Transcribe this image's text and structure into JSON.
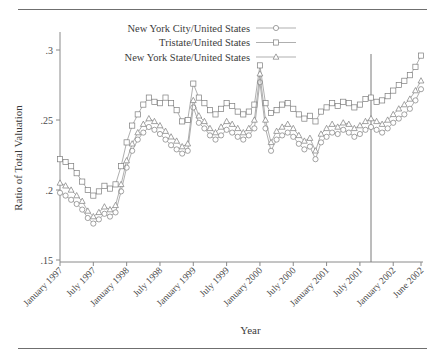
{
  "figure": {
    "ylabel": "Ratio of Total Valuation",
    "xlabel": "Year",
    "y_ticks": [
      ".3",
      ".25",
      ".2",
      ".15"
    ],
    "x_ticks": [
      "January 1997",
      "July 1997",
      "January 1998",
      "July 1998",
      "January 1999",
      "July 1999",
      "January 2000",
      "July 2000",
      "January 2001",
      "July 2001",
      "January 2002",
      "June 2002"
    ],
    "legend": [
      {
        "label": "New York City/United States",
        "marker": "circle"
      },
      {
        "label": "Tristate/United States",
        "marker": "square"
      },
      {
        "label": "New York State/United States",
        "marker": "triangle"
      }
    ],
    "colors": {
      "line": "#8c8c8c",
      "marker_fill": "#ffffff",
      "marker_stroke": "#7d7d7d",
      "vline": "#7a7a7a",
      "axis": "#8a8a8a"
    }
  },
  "chart_data": {
    "type": "line",
    "title": "",
    "xlabel": "Year",
    "ylabel": "Ratio of Total Valuation",
    "ylim": [
      0.15,
      0.305
    ],
    "grid": false,
    "legend_position": "top-center",
    "annotations": [
      {
        "type": "vertical-line",
        "x": "September 2001",
        "label": ""
      }
    ],
    "x_tick_labels": [
      "January 1997",
      "July 1997",
      "January 1998",
      "July 1998",
      "January 1999",
      "July 1999",
      "January 2000",
      "July 2000",
      "January 2001",
      "July 2001",
      "January 2002",
      "June 2002"
    ],
    "y_tick_values": [
      0.3,
      0.25,
      0.2,
      0.15
    ],
    "x": [
      "1997-01",
      "1997-02",
      "1997-03",
      "1997-04",
      "1997-05",
      "1997-06",
      "1997-07",
      "1997-08",
      "1997-09",
      "1997-10",
      "1997-11",
      "1997-12",
      "1998-01",
      "1998-02",
      "1998-03",
      "1998-04",
      "1998-05",
      "1998-06",
      "1998-07",
      "1998-08",
      "1998-09",
      "1998-10",
      "1998-11",
      "1998-12",
      "1999-01",
      "1999-02",
      "1999-03",
      "1999-04",
      "1999-05",
      "1999-06",
      "1999-07",
      "1999-08",
      "1999-09",
      "1999-10",
      "1999-11",
      "1999-12",
      "2000-01",
      "2000-02",
      "2000-03",
      "2000-04",
      "2000-05",
      "2000-06",
      "2000-07",
      "2000-08",
      "2000-09",
      "2000-10",
      "2000-11",
      "2000-12",
      "2001-01",
      "2001-02",
      "2001-03",
      "2001-04",
      "2001-05",
      "2001-06",
      "2001-07",
      "2001-08",
      "2001-09",
      "2001-10",
      "2001-11",
      "2001-12",
      "2002-01",
      "2002-02",
      "2002-03",
      "2002-04",
      "2002-05",
      "2002-06"
    ],
    "series": [
      {
        "name": "New York City/United States",
        "marker": "circle",
        "values": [
          0.198,
          0.196,
          0.193,
          0.19,
          0.186,
          0.18,
          0.176,
          0.179,
          0.183,
          0.181,
          0.184,
          0.199,
          0.216,
          0.228,
          0.236,
          0.241,
          0.245,
          0.243,
          0.24,
          0.236,
          0.232,
          0.229,
          0.226,
          0.228,
          0.259,
          0.248,
          0.244,
          0.239,
          0.236,
          0.239,
          0.243,
          0.241,
          0.238,
          0.236,
          0.239,
          0.244,
          0.277,
          0.244,
          0.228,
          0.236,
          0.239,
          0.241,
          0.238,
          0.233,
          0.229,
          0.231,
          0.222,
          0.234,
          0.238,
          0.241,
          0.24,
          0.243,
          0.241,
          0.238,
          0.24,
          0.243,
          0.245,
          0.243,
          0.241,
          0.244,
          0.248,
          0.251,
          0.254,
          0.258,
          0.264,
          0.272
        ]
      },
      {
        "name": "Tristate/United States",
        "marker": "square",
        "values": [
          0.222,
          0.22,
          0.217,
          0.212,
          0.206,
          0.2,
          0.196,
          0.199,
          0.203,
          0.201,
          0.204,
          0.217,
          0.234,
          0.246,
          0.254,
          0.261,
          0.266,
          0.263,
          0.262,
          0.266,
          0.262,
          0.257,
          0.249,
          0.25,
          0.276,
          0.266,
          0.262,
          0.257,
          0.254,
          0.258,
          0.262,
          0.26,
          0.256,
          0.254,
          0.256,
          0.261,
          0.289,
          0.262,
          0.255,
          0.257,
          0.261,
          0.262,
          0.258,
          0.254,
          0.251,
          0.253,
          0.249,
          0.256,
          0.259,
          0.262,
          0.26,
          0.263,
          0.262,
          0.259,
          0.261,
          0.265,
          0.266,
          0.263,
          0.264,
          0.267,
          0.271,
          0.275,
          0.278,
          0.282,
          0.288,
          0.296
        ]
      },
      {
        "name": "New York State/United States",
        "marker": "triangle",
        "values": [
          0.205,
          0.203,
          0.2,
          0.196,
          0.192,
          0.185,
          0.181,
          0.184,
          0.188,
          0.186,
          0.189,
          0.204,
          0.221,
          0.233,
          0.241,
          0.247,
          0.251,
          0.249,
          0.246,
          0.242,
          0.238,
          0.235,
          0.231,
          0.233,
          0.264,
          0.253,
          0.249,
          0.244,
          0.241,
          0.245,
          0.249,
          0.247,
          0.244,
          0.241,
          0.244,
          0.25,
          0.283,
          0.25,
          0.234,
          0.242,
          0.245,
          0.247,
          0.244,
          0.239,
          0.235,
          0.237,
          0.228,
          0.24,
          0.244,
          0.247,
          0.245,
          0.248,
          0.247,
          0.244,
          0.246,
          0.249,
          0.251,
          0.249,
          0.247,
          0.25,
          0.254,
          0.258,
          0.261,
          0.265,
          0.271,
          0.278
        ]
      }
    ]
  }
}
